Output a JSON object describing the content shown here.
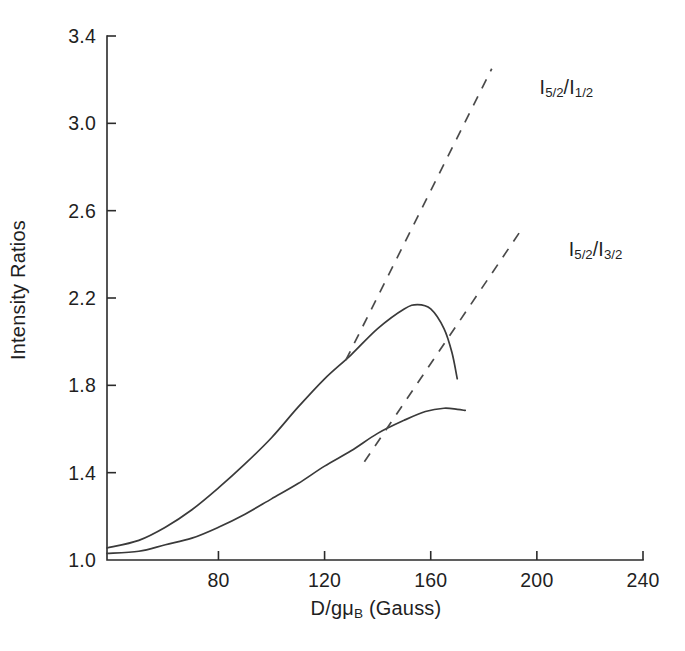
{
  "chart_data": {
    "type": "line",
    "title": "",
    "xlabel": "D/gμ_B (Gauss)",
    "xlabel_parts": {
      "prefix": "D/gμ",
      "sub": "B",
      "suffix": " (Gauss)"
    },
    "ylabel": "Intensity Ratios",
    "xlim": [
      38,
      240
    ],
    "ylim": [
      1.0,
      3.4
    ],
    "xticks": [
      80,
      120,
      160,
      200,
      240
    ],
    "xtick_labels": [
      "80",
      "120",
      "160",
      "200",
      "240"
    ],
    "yticks": [
      1.0,
      1.4,
      1.8,
      2.2,
      2.6,
      3.0,
      3.4
    ],
    "ytick_labels": [
      "1.0",
      "1.4",
      "1.8",
      "2.2",
      "2.6",
      "3.0",
      "3.4"
    ],
    "grid": false,
    "legend": "inline-annotations",
    "series": [
      {
        "name": "I_5/2 / I_1/2",
        "label_parts": {
          "num_sub": "5/2",
          "den_sub": "1/2"
        },
        "style": "solid",
        "annotation_x": 201,
        "annotation_y": 3.16,
        "points": [
          {
            "x": 38,
            "y": 1.055
          },
          {
            "x": 50,
            "y": 1.09
          },
          {
            "x": 60,
            "y": 1.15
          },
          {
            "x": 70,
            "y": 1.23
          },
          {
            "x": 80,
            "y": 1.33
          },
          {
            "x": 90,
            "y": 1.44
          },
          {
            "x": 100,
            "y": 1.56
          },
          {
            "x": 110,
            "y": 1.7
          },
          {
            "x": 120,
            "y": 1.83
          },
          {
            "x": 130,
            "y": 1.94
          },
          {
            "x": 140,
            "y": 2.06
          },
          {
            "x": 150,
            "y": 2.15
          },
          {
            "x": 155,
            "y": 2.17
          },
          {
            "x": 160,
            "y": 2.15
          },
          {
            "x": 165,
            "y": 2.06
          },
          {
            "x": 168,
            "y": 1.95
          },
          {
            "x": 170,
            "y": 1.83
          }
        ]
      },
      {
        "name": "I_5/2 / I_3/2",
        "label_parts": {
          "num_sub": "5/2",
          "den_sub": "3/2"
        },
        "style": "solid",
        "annotation_x": 212,
        "annotation_y": 2.42,
        "points": [
          {
            "x": 38,
            "y": 1.03
          },
          {
            "x": 50,
            "y": 1.04
          },
          {
            "x": 60,
            "y": 1.07
          },
          {
            "x": 70,
            "y": 1.1
          },
          {
            "x": 80,
            "y": 1.15
          },
          {
            "x": 90,
            "y": 1.21
          },
          {
            "x": 100,
            "y": 1.28
          },
          {
            "x": 110,
            "y": 1.35
          },
          {
            "x": 120,
            "y": 1.43
          },
          {
            "x": 130,
            "y": 1.5
          },
          {
            "x": 140,
            "y": 1.58
          },
          {
            "x": 150,
            "y": 1.64
          },
          {
            "x": 158,
            "y": 1.68
          },
          {
            "x": 165,
            "y": 1.695
          },
          {
            "x": 170,
            "y": 1.69
          },
          {
            "x": 173,
            "y": 1.685
          }
        ]
      },
      {
        "name": "I_5/2 / I_1/2 asymptote",
        "style": "dashed",
        "points": [
          {
            "x": 128,
            "y": 1.915
          },
          {
            "x": 183,
            "y": 3.25
          }
        ]
      },
      {
        "name": "I_5/2 / I_3/2 asymptote",
        "style": "dashed",
        "points": [
          {
            "x": 135,
            "y": 1.45
          },
          {
            "x": 194,
            "y": 2.51
          }
        ]
      }
    ]
  },
  "annotations": {
    "upper_curve_label": "I5/2/I1/2",
    "lower_curve_label": "I5/2/I3/2"
  },
  "axes": {
    "y_title": "Intensity Ratios",
    "x_title_prefix": "D/gμ",
    "x_title_sub": "B",
    "x_title_suffix": " (Gauss)"
  },
  "colors": {
    "axis": "#2b2b2b",
    "curve": "#3a3a3a",
    "dashed": "#4a4a4a",
    "background": "#ffffff",
    "text": "#1f1f1f"
  }
}
